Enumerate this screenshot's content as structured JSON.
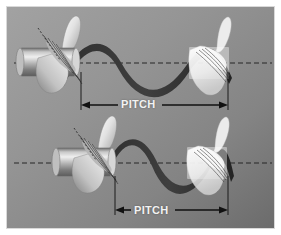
{
  "figure": {
    "title_visible": false,
    "background_color": "#8d8d8d",
    "border_color": "#f2f2f2",
    "frame_width": 281,
    "frame_height": 235
  },
  "labels": {
    "pitch_top": "PITCH",
    "pitch_bottom": "PITCH"
  },
  "colors": {
    "background_light": "#9a9a9a",
    "background_dark": "#6f6f6f",
    "wave": "#3c3c3c",
    "propeller_solid_light": "#e8e8e8",
    "propeller_solid_mid": "#a8a8a8",
    "propeller_ghost": "#f0f0f0",
    "dimension_line": "#1a1a1a",
    "centerline": "#2a2a2a",
    "label_text": "#f2f2f2"
  },
  "diagrams": [
    {
      "id": "top-diagram",
      "name": "low-pitch-propeller",
      "centerline_y": 63,
      "wave": {
        "start_x": 60,
        "end_x": 232,
        "amplitude": 44,
        "cycles": 1
      },
      "dimension": {
        "left_x": 81,
        "right_x": 228,
        "y": 105,
        "label": "PITCH"
      },
      "propellers": [
        {
          "role": "start",
          "cx": 52,
          "cy": 63,
          "style": "solid"
        },
        {
          "role": "end",
          "cx": 214,
          "cy": 63,
          "style": "ghost"
        }
      ]
    },
    {
      "id": "bottom-diagram",
      "name": "high-pitch-propeller",
      "centerline_y": 163,
      "wave": {
        "start_x": 118,
        "end_x": 232,
        "amplitude": 44,
        "cycles": 1
      },
      "dimension": {
        "left_x": 115,
        "right_x": 228,
        "y": 210,
        "label": "PITCH"
      },
      "propellers": [
        {
          "role": "start",
          "cx": 88,
          "cy": 163,
          "style": "solid"
        },
        {
          "role": "end",
          "cx": 212,
          "cy": 163,
          "style": "ghost"
        }
      ]
    }
  ]
}
